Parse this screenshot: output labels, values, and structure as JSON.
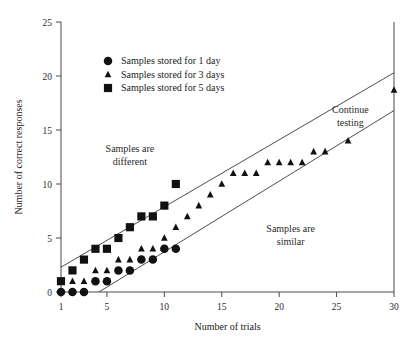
{
  "chart_data": {
    "type": "scatter",
    "title": "",
    "xlabel": "Number of trials",
    "ylabel": "Number of correct responses",
    "xlim": [
      1,
      30
    ],
    "ylim": [
      0,
      25
    ],
    "xticks": [
      1,
      5,
      10,
      15,
      20,
      25,
      30
    ],
    "yticks": [
      0,
      5,
      10,
      15,
      20,
      25
    ],
    "xtick_labels": [
      "1",
      "5",
      "10",
      "15",
      "20",
      "25",
      "30"
    ],
    "ytick_labels": [
      "0",
      "5",
      "10",
      "15",
      "20",
      "25"
    ],
    "grid": false,
    "legend_position": "upper-left-inside",
    "series": [
      {
        "name": "Samples stored for 1 day",
        "marker": "circle",
        "color": "#111111",
        "points": [
          [
            1,
            0
          ],
          [
            2,
            0
          ],
          [
            3,
            0
          ],
          [
            4,
            1
          ],
          [
            5,
            1
          ],
          [
            6,
            2
          ],
          [
            7,
            2
          ],
          [
            8,
            3
          ],
          [
            9,
            3
          ],
          [
            10,
            4
          ],
          [
            11,
            4
          ]
        ]
      },
      {
        "name": "Samples stored for 3 days",
        "marker": "triangle",
        "color": "#111111",
        "points": [
          [
            1,
            1
          ],
          [
            2,
            1
          ],
          [
            3,
            1
          ],
          [
            4,
            2
          ],
          [
            5,
            2
          ],
          [
            6,
            3
          ],
          [
            7,
            3
          ],
          [
            8,
            4
          ],
          [
            9,
            4
          ],
          [
            10,
            5
          ],
          [
            11,
            6
          ],
          [
            12,
            7
          ],
          [
            13,
            8
          ],
          [
            14,
            9
          ],
          [
            15,
            10
          ],
          [
            16,
            11
          ],
          [
            17,
            11
          ],
          [
            18,
            11
          ],
          [
            19,
            12
          ],
          [
            20,
            12
          ],
          [
            21,
            12
          ],
          [
            22,
            12
          ],
          [
            23,
            13
          ],
          [
            24,
            13
          ],
          [
            26,
            14
          ],
          [
            30,
            18.7
          ]
        ]
      },
      {
        "name": "Samples stored for 5 days",
        "marker": "square",
        "color": "#111111",
        "points": [
          [
            1,
            1
          ],
          [
            2,
            2
          ],
          [
            3,
            3
          ],
          [
            4,
            4
          ],
          [
            5,
            4
          ],
          [
            6,
            5
          ],
          [
            7,
            6
          ],
          [
            8,
            7
          ],
          [
            9,
            7
          ],
          [
            10,
            8
          ],
          [
            11,
            10
          ]
        ]
      }
    ],
    "boundary_lines": [
      {
        "name": "upper-decision-boundary",
        "from": [
          1,
          2.3
        ],
        "to": [
          30,
          20.3
        ]
      },
      {
        "name": "lower-decision-boundary",
        "from": [
          4.3,
          0
        ],
        "to": [
          30,
          16.8
        ]
      }
    ],
    "annotations": [
      {
        "name": "samples-are-different",
        "lines": [
          "Samples are",
          "different"
        ],
        "x": 7.0,
        "y": 13.0
      },
      {
        "name": "continue-testing",
        "lines": [
          "Continue",
          "testing"
        ],
        "x": 26.2,
        "y": 16.6
      },
      {
        "name": "samples-are-similar",
        "lines": [
          "Samples are",
          "similar"
        ],
        "x": 21.0,
        "y": 5.6
      }
    ]
  },
  "legend": {
    "items": [
      {
        "label": "Samples stored for 1 day",
        "marker": "circle"
      },
      {
        "label": "Samples stored for 3 days",
        "marker": "triangle"
      },
      {
        "label": "Samples stored for 5 days",
        "marker": "square"
      }
    ]
  },
  "colors": {
    "marker": "#111111",
    "axis": "#4a4a4a",
    "boundary": "#3a3a3a",
    "background": "#ffffff"
  }
}
